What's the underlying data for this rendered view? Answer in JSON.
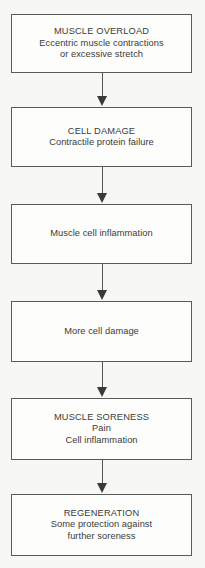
{
  "diagram": {
    "type": "vertical-flowchart",
    "orientation": "top-to-bottom",
    "background_color": "#f7f7f5",
    "box_fill_color": "#fdfdfc",
    "box_border_color": "#5a5a5a",
    "text_color": "#3b3b3b",
    "arrow_color": "#3a3a3a",
    "node_count": 6,
    "connector_count": 5,
    "nodes": [
      {
        "id": "muscle-overload",
        "lines": [
          "MUSCLE OVERLOAD",
          "Eccentric muscle contractions",
          "or excessive stretch"
        ],
        "heading": "MUSCLE OVERLOAD",
        "x": 11,
        "y": 14,
        "width": 181,
        "height": 59
      },
      {
        "id": "cell-damage",
        "lines": [
          "CELL DAMAGE",
          "Contractile protein failure"
        ],
        "heading": "CELL DAMAGE",
        "x": 11,
        "y": 107,
        "width": 181,
        "height": 60
      },
      {
        "id": "muscle-cell-inflammation",
        "lines": [
          "Muscle cell inflammation"
        ],
        "heading": "",
        "x": 11,
        "y": 204,
        "width": 181,
        "height": 60
      },
      {
        "id": "more-cell-damage",
        "lines": [
          "More cell damage"
        ],
        "heading": "",
        "x": 11,
        "y": 301,
        "width": 181,
        "height": 61
      },
      {
        "id": "muscle-soreness",
        "lines": [
          "MUSCLE SORENESS",
          "Pain",
          "Cell inflammation"
        ],
        "heading": "MUSCLE SORENESS",
        "x": 11,
        "y": 398,
        "width": 181,
        "height": 62
      },
      {
        "id": "regeneration",
        "lines": [
          "REGENERATION",
          "Some protection against",
          "further soreness"
        ],
        "heading": "REGENERATION",
        "x": 11,
        "y": 494,
        "width": 181,
        "height": 62
      }
    ],
    "connectors": [
      {
        "id": "arrow-overload-to-damage",
        "from": "muscle-overload",
        "to": "cell-damage",
        "y": 73,
        "length": 34
      },
      {
        "id": "arrow-damage-to-inflammation",
        "from": "cell-damage",
        "to": "muscle-cell-inflammation",
        "y": 167,
        "length": 37
      },
      {
        "id": "arrow-inflammation-to-more-damage",
        "from": "muscle-cell-inflammation",
        "to": "more-cell-damage",
        "y": 264,
        "length": 37
      },
      {
        "id": "arrow-more-damage-to-soreness",
        "from": "more-cell-damage",
        "to": "muscle-soreness",
        "y": 362,
        "length": 36
      },
      {
        "id": "arrow-soreness-to-regeneration",
        "from": "muscle-soreness",
        "to": "regeneration",
        "y": 460,
        "length": 34
      }
    ]
  }
}
